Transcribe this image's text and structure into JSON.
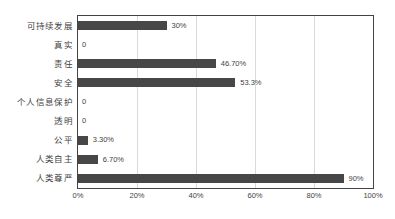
{
  "chart_data": {
    "type": "bar",
    "orientation": "horizontal",
    "title": "",
    "xlabel": "",
    "ylabel": "",
    "xlim": [
      0,
      100
    ],
    "grid": true,
    "legend": false,
    "categories": [
      "可持续发展",
      "真实",
      "责任",
      "安全",
      "个人信息保护",
      "透明",
      "公平",
      "人类自主",
      "人类尊严"
    ],
    "values": [
      30,
      0,
      46.7,
      53.3,
      0,
      0,
      3.3,
      6.7,
      90
    ],
    "data_labels": [
      "30%",
      "0",
      "46.70%",
      "53.3%",
      "0",
      "0",
      "3.30%",
      "6.70%",
      "90%"
    ],
    "xticks": [
      0,
      20,
      40,
      60,
      80,
      100
    ],
    "xtick_labels": [
      "0%",
      "20%",
      "40%",
      "60%",
      "80%",
      "100%"
    ],
    "gridlines": [
      20,
      40,
      60,
      80
    ],
    "bar_color": "#474747",
    "grid_color": "#d9d9d9",
    "axis_color": "#444444",
    "text_color": "#3f3f3f"
  }
}
